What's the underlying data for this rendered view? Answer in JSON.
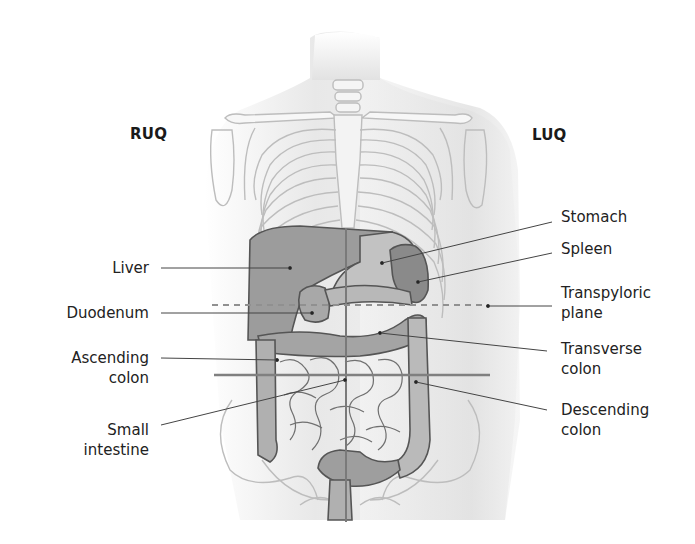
{
  "figure": {
    "quadrants": {
      "upper_right": "RUQ",
      "upper_left": "LUQ"
    },
    "labels_left": [
      {
        "id": "liver",
        "line1": "Liver",
        "line2": ""
      },
      {
        "id": "duodenum",
        "line1": "Duodenum",
        "line2": ""
      },
      {
        "id": "ascending-colon",
        "line1": "Ascending",
        "line2": "colon"
      },
      {
        "id": "small-intestine",
        "line1": "Small",
        "line2": "intestine"
      }
    ],
    "labels_right": [
      {
        "id": "stomach",
        "line1": "Stomach",
        "line2": ""
      },
      {
        "id": "spleen",
        "line1": "Spleen",
        "line2": ""
      },
      {
        "id": "transpyloric-plane",
        "line1": "Transpyloric",
        "line2": "plane"
      },
      {
        "id": "transverse-colon",
        "line1": "Transverse",
        "line2": "colon"
      },
      {
        "id": "descending-colon",
        "line1": "Descending",
        "line2": "colon"
      }
    ],
    "colors": {
      "skin_shade": "#e6e6e6",
      "bone_line": "#b8b8b8",
      "organ_dark": "#8c8c8c",
      "organ_mid": "#a6a6a6",
      "organ_light": "#c4c4c4",
      "leader_line": "#444444",
      "plane_line": "#888888"
    }
  }
}
